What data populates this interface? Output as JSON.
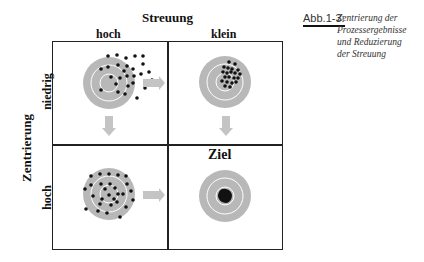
{
  "figure": {
    "title_top": "Streuung",
    "columns": [
      "hoch",
      "klein"
    ],
    "axis_left": "Zentrierung",
    "rows": [
      "niedrig",
      "hoch"
    ],
    "target_label": "Ziel",
    "caption_label": "Abb.1-3:",
    "caption_lines": [
      "Zentrierung der",
      "Prozessergebnisse",
      "und Reduzierung",
      "der Streuung"
    ]
  },
  "quadrants": [
    {
      "position": "top-left",
      "streuung": "hoch",
      "zentrierung": "niedrig",
      "description": "scattered dots, off-center upper right",
      "arrows": [
        "right",
        "down"
      ]
    },
    {
      "position": "top-right",
      "streuung": "klein",
      "zentrierung": "niedrig",
      "description": "tight cluster, off-center upper right",
      "arrows": [
        "down"
      ]
    },
    {
      "position": "bottom-left",
      "streuung": "hoch",
      "zentrierung": "hoch",
      "description": "scattered dots, centered",
      "arrows": [
        "right"
      ]
    },
    {
      "position": "bottom-right",
      "streuung": "klein",
      "zentrierung": "hoch",
      "description": "tight cluster, centered",
      "arrows": []
    }
  ],
  "colors": {
    "target_ring": "#b8b8b8",
    "target_line": "#ffffff",
    "dot": "#111111",
    "arrow": "#c4c4c4",
    "grid_line": "#222222"
  }
}
